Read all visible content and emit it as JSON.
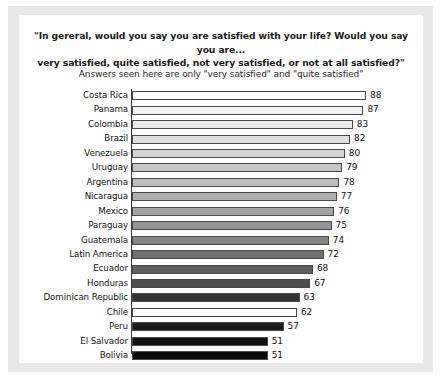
{
  "chart_data": {
    "type": "bar",
    "orientation": "horizontal",
    "title": "\"In gereral, would you say you are satisfied with your life? Would you say you are... very satisfied, quite satisfied, not very satisfied, or not at all satisfied?\"",
    "title_line1": "\"In gereral, would you say you are satisfied with your life? Would you say you are...",
    "title_line2": "very satisfied, quite satisfied, not very satisfied, or not at all satisfied?\"",
    "subtitle": "Answers seen here are only \"very satisfied\" and \"quite satisfied\"",
    "xlabel": "",
    "ylabel": "",
    "xlim": [
      0,
      88
    ],
    "grid": false,
    "legend": false,
    "categories": [
      "Costa Rica",
      "Panama",
      "Colombia",
      "Brazil",
      "Venezuela",
      "Uruguay",
      "Argentina",
      "Nicaragua",
      "Mexico",
      "Paraguay",
      "Guatemala",
      "Latin America",
      "Ecuador",
      "Honduras",
      "Dominican Republic",
      "Chile",
      "Peru",
      "El Salvador",
      "Bolivia"
    ],
    "values": [
      88,
      87,
      83,
      82,
      80,
      79,
      78,
      77,
      76,
      75,
      74,
      72,
      68,
      67,
      63,
      62,
      57,
      51,
      51
    ],
    "bars": [
      {
        "label": "Costa Rica",
        "value": 88,
        "value_text": "88",
        "color": "#fcfcfc"
      },
      {
        "label": "Panama",
        "value": 87,
        "value_text": "87",
        "color": "#f2f2f2"
      },
      {
        "label": "Colombia",
        "value": 83,
        "value_text": "83",
        "color": "#ebebeb"
      },
      {
        "label": "Brazil",
        "value": 82,
        "value_text": "82",
        "color": "#e0e0e0"
      },
      {
        "label": "Venezuela",
        "value": 80,
        "value_text": "80",
        "color": "#d4d4d4"
      },
      {
        "label": "Uruguay",
        "value": 79,
        "value_text": "79",
        "color": "#c6c6c6"
      },
      {
        "label": "Argentina",
        "value": 78,
        "value_text": "78",
        "color": "#bcbcbc"
      },
      {
        "label": "Nicaragua",
        "value": 77,
        "value_text": "77",
        "color": "#b0b0b0"
      },
      {
        "label": "Mexico",
        "value": 76,
        "value_text": "76",
        "color": "#a2a2a2"
      },
      {
        "label": "Paraguay",
        "value": 75,
        "value_text": "75",
        "color": "#949494"
      },
      {
        "label": "Guatemala",
        "value": 74,
        "value_text": "74",
        "color": "#868686"
      },
      {
        "label": "Latin America",
        "value": 72,
        "value_text": "72",
        "color": "#707070"
      },
      {
        "label": "Ecuador",
        "value": 68,
        "value_text": "68",
        "color": "#606060"
      },
      {
        "label": "Honduras",
        "value": 67,
        "value_text": "67",
        "color": "#4e4e4e"
      },
      {
        "label": "Dominican Republic",
        "value": 63,
        "value_text": "63",
        "color": "#343434"
      },
      {
        "label": "Chile",
        "value": 62,
        "value_text": "62",
        "color": "#ffffff"
      },
      {
        "label": "Peru",
        "value": 57,
        "value_text": "57",
        "color": "#1a1a1a"
      },
      {
        "label": "El Salvador",
        "value": 51,
        "value_text": "51",
        "color": "#101010"
      },
      {
        "label": "Bolivia",
        "value": 51,
        "value_text": "51",
        "color": "#0a0a0a"
      }
    ]
  },
  "style": {
    "frame_color": "#e8e8e8",
    "canvas_color": "#ffffff",
    "axis_color": "#3a3a3a",
    "text_color": "#141414"
  }
}
